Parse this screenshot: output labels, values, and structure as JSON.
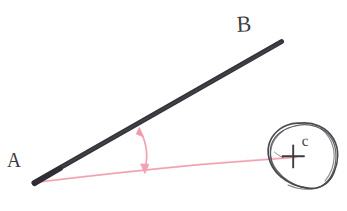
{
  "figure": {
    "type": "geometry-angle-diagram",
    "background_color": "#ffffff",
    "width": 347,
    "height": 211,
    "labels": {
      "vertex_label": "A",
      "ray_label": "B",
      "point_label": "c"
    },
    "colors": {
      "ink_black": "#3a3a3e",
      "ink_gray": "#4a4a50",
      "pink": "#f2a8b6",
      "pink_light": "#f6c2cb",
      "pink_arrow": "#f08fa1"
    },
    "elements": {
      "ray_ab": {
        "name": "black-ray-from-A-to-B",
        "from": [
          34,
          182
        ],
        "to": [
          281,
          42
        ],
        "stroke_width": 4.6,
        "color": "#3a3a3e"
      },
      "ray_ac": {
        "name": "pink-ray-from-A-to-c",
        "from": [
          34,
          182
        ],
        "to": [
          296,
          157
        ],
        "stroke_width": 1.5,
        "color": "#f5b9c3"
      },
      "angle_arc": {
        "name": "double-headed-angle-arc",
        "from": [
          140,
          129
        ],
        "to": [
          145,
          171
        ],
        "color": "#f2a0b0",
        "double_headed": true
      },
      "blob": {
        "name": "hand-drawn-enclosing-blob",
        "center": [
          301,
          155
        ],
        "radius_x": 35,
        "radius_y": 33,
        "stroke_width": 1.6,
        "color": "#4a4a50"
      },
      "plus_mark": {
        "name": "plus-cross-point-marker",
        "center": [
          293,
          156
        ],
        "arm": 11,
        "stroke_width": 1.8,
        "color": "#3c3c40"
      }
    }
  }
}
